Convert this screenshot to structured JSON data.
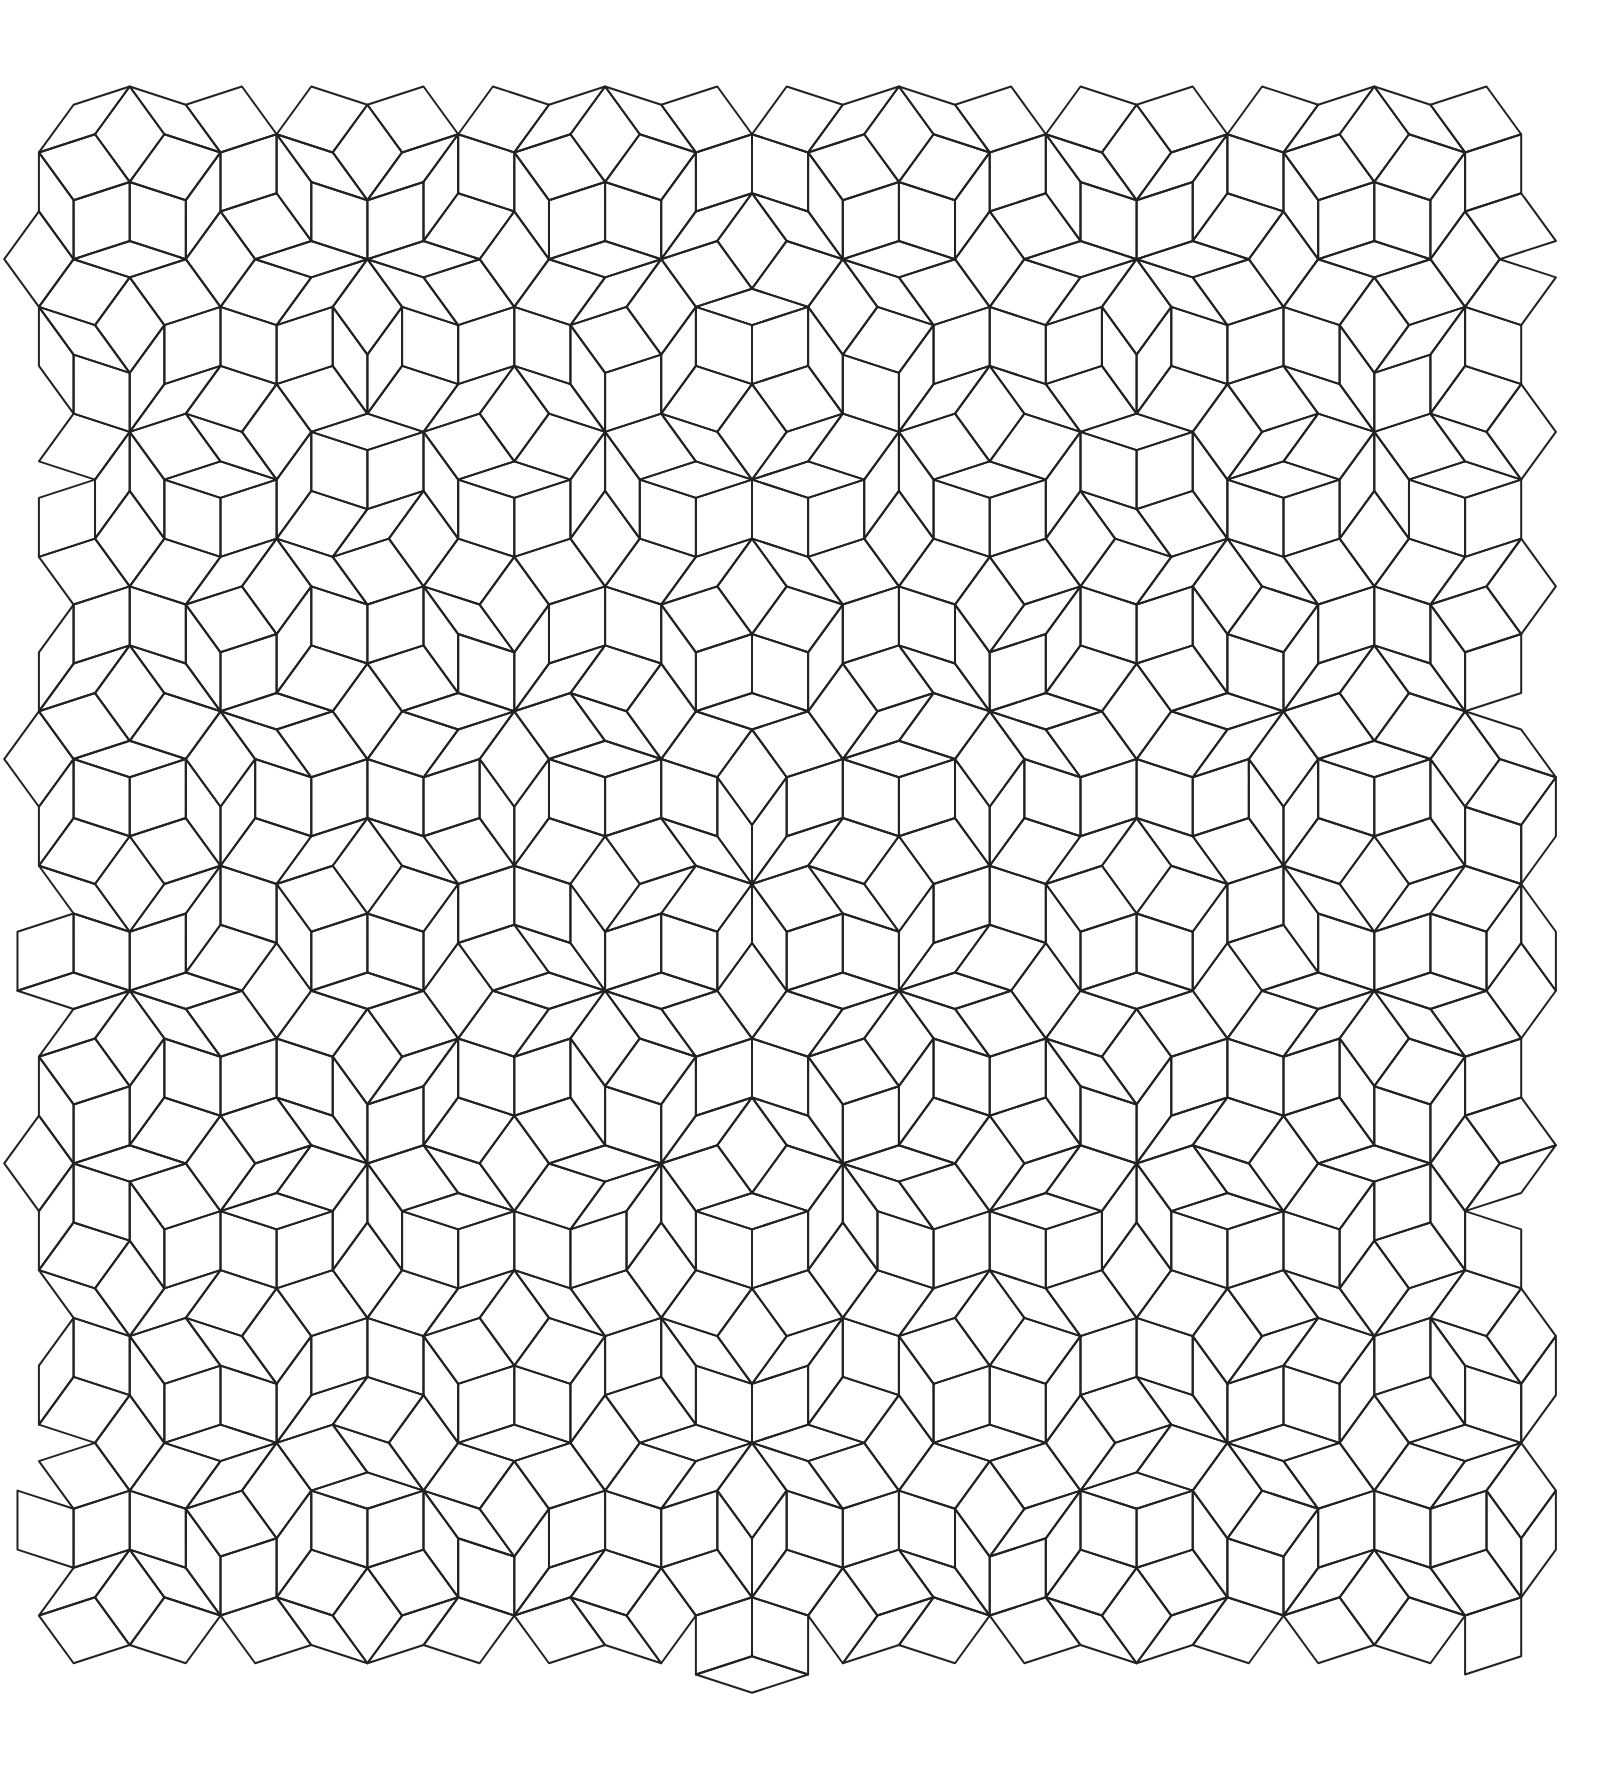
{
  "figure": {
    "tile_types": [
      "thick-rhombus",
      "thin-rhombus"
    ],
    "edge_directions_deg": [
      18,
      54,
      90,
      126,
      162
    ],
    "edge_length_px": 59,
    "patch_bounds": {
      "left": 4,
      "top": 48,
      "right": 1558,
      "bottom": 1720
    },
    "symmetry_axis_x": 752,
    "star_vertices": [
      [
        751,
        52
      ],
      [
        754,
        1716
      ]
    ],
    "pentagrid_offsets": [
      0.2,
      0.2,
      0.2,
      0.2,
      0.2
    ],
    "origin": {
      "x": 752,
      "y": 884
    },
    "colors": {
      "background": "#ffffff",
      "stroke": "#222222"
    },
    "stroke_width": 2
  }
}
